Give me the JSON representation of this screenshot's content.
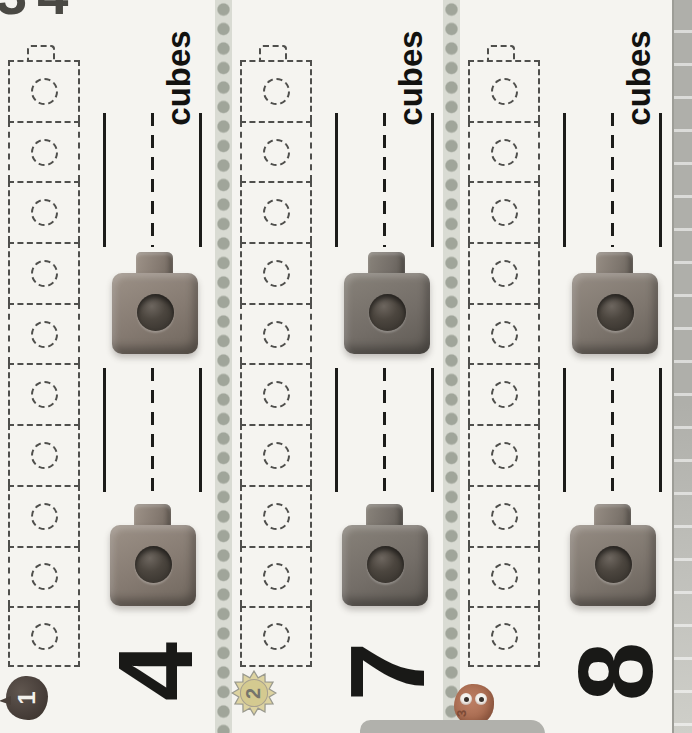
{
  "page": {
    "partial_page_number": "34"
  },
  "sections": [
    {
      "number": "4",
      "unit_label": "cubes",
      "badge": {
        "label": "1",
        "icon": "apple-icon"
      },
      "train_cell_count": 10,
      "answer_blank_count": 2,
      "cube_photo_count": 2
    },
    {
      "number": "7",
      "unit_label": "cubes",
      "badge": {
        "label": "2",
        "icon": "sun-icon"
      },
      "train_cell_count": 10,
      "answer_blank_count": 2,
      "cube_photo_count": 2
    },
    {
      "number": "8",
      "unit_label": "cubes",
      "badge": {
        "label": "3",
        "icon": "monster-icon"
      },
      "train_cell_count": 10,
      "answer_blank_count": 2,
      "cube_photo_count": 2
    }
  ],
  "colors": {
    "page_bg": "#f5f4f0",
    "rule_color": "#1c1c1a",
    "dash_outline": "#4f4f4c",
    "separator_dot": "#a0a59a",
    "separator_band": "#d9dbd3",
    "edge_strip": "#afafaa",
    "cube_section1": "#857a71",
    "cube_section2": "#746e68",
    "cube_section3": "#7e766e",
    "apple_badge": "#473e39",
    "sun_badge_fill": "#ddd3a0",
    "monster_badge": "#aa6d52"
  }
}
